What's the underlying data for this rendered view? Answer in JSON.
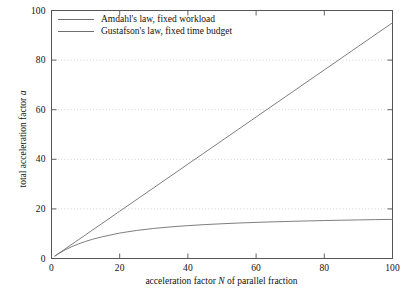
{
  "chart_data": {
    "type": "line",
    "title": "",
    "xlabel": "acceleration factor N of parallel fraction",
    "xlabel_prefix": "acceleration factor ",
    "xlabel_var": "N",
    "xlabel_suffix": " of parallel fraction",
    "ylabel": "total acceleration factor a",
    "ylabel_prefix": "total acceleration factor ",
    "ylabel_var": "a",
    "xlim": [
      0,
      100
    ],
    "ylim": [
      0,
      100
    ],
    "xticks": [
      0,
      20,
      40,
      60,
      80,
      100
    ],
    "yticks": [
      0,
      20,
      40,
      60,
      80,
      100
    ],
    "xtick_labels": [
      "0",
      "20",
      "40",
      "60",
      "80",
      "100"
    ],
    "ytick_labels": [
      "0",
      "20",
      "40",
      "60",
      "80",
      "100"
    ],
    "grid": "horizontal-dotted",
    "gridlines_y": [
      20,
      40,
      60,
      80
    ],
    "legend_position": "top-left",
    "line_color": "#6f6f6f",
    "axis_color": "#555555",
    "grid_color": "#bbbbbb",
    "background": "#ffffff",
    "parallel_fraction": 0.95,
    "series": [
      {
        "name": "Amdahl's law, fixed workload",
        "formula": "a = 1 / ((1-p) + p/N)",
        "x": [
          1,
          2,
          4,
          6,
          8,
          10,
          12,
          15,
          20,
          25,
          30,
          35,
          40,
          45,
          50,
          55,
          60,
          65,
          70,
          75,
          80,
          85,
          90,
          95,
          100
        ],
        "values": [
          1.0,
          1.9,
          3.48,
          4.81,
          5.93,
          6.9,
          7.74,
          8.79,
          10.26,
          11.32,
          12.12,
          12.75,
          13.25,
          13.67,
          14.01,
          14.31,
          14.56,
          14.78,
          14.97,
          15.14,
          15.3,
          15.43,
          15.56,
          15.67,
          15.77
        ]
      },
      {
        "name": "Gustafson's law, fixed time budget",
        "formula": "a = (1-p) + pN",
        "x": [
          1,
          10,
          20,
          30,
          40,
          50,
          60,
          70,
          80,
          90,
          100
        ],
        "values": [
          1.0,
          9.55,
          19.05,
          28.55,
          38.05,
          47.55,
          57.05,
          66.55,
          76.05,
          85.55,
          95.05
        ]
      }
    ]
  },
  "legend": {
    "items": [
      {
        "label": "Amdahl's law, fixed workload"
      },
      {
        "label": "Gustafson's law, fixed time budget"
      }
    ]
  }
}
